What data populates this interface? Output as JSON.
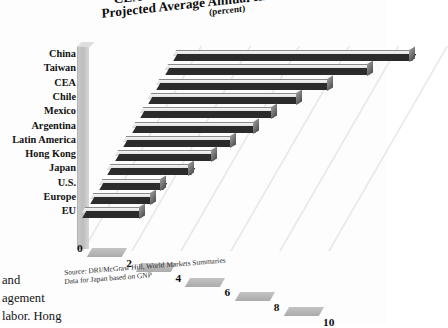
{
  "title": {
    "line1": "CEA Growth Relative to Other Regions",
    "line2": "Projected Average Annual Increases in GDP",
    "line3": "(percent)"
  },
  "source_note": {
    "line1": "Source: DRI/McGraw Hill, World Markets Summaries",
    "line2": "Data for Japan based on GNP"
  },
  "page_text": {
    "line1": "and",
    "line2": "agement",
    "line3": "labor.  Hong"
  },
  "colors": {
    "bar_face": "#2b2b2b",
    "bar_top": "#e2e2e2",
    "bar_cap": "#6d6d6d",
    "grid": "#e9e9e9",
    "wall": "#c3c3c3",
    "floor": "#b4b4b4",
    "text": "#121212"
  },
  "chart_data": {
    "type": "bar",
    "orientation": "horizontal",
    "xlabel": "",
    "ylabel": "",
    "xlim": [
      0,
      10
    ],
    "xticks": [
      0,
      2,
      4,
      6,
      8,
      10
    ],
    "grid": true,
    "legend": "none",
    "style": "3d-perspective",
    "categories": [
      "China",
      "Taiwan",
      "CEA",
      "Chile",
      "Mexico",
      "Argentina",
      "Latin America",
      "Hong Kong",
      "Japan",
      "U.S.",
      "Europe",
      "EU"
    ],
    "values": [
      9.7,
      8.3,
      7.0,
      6.1,
      5.4,
      5.0,
      4.4,
      4.0,
      3.4,
      2.6,
      2.5,
      2.4
    ],
    "series": [
      {
        "name": "Projected average annual increase in GDP 1993-1999 (percent)",
        "values": [
          9.7,
          8.3,
          7.0,
          6.1,
          5.4,
          5.0,
          4.4,
          4.0,
          3.4,
          2.6,
          2.5,
          2.4
        ]
      }
    ],
    "annotations": [
      "Source: DRI/McGraw Hill, World Markets Summaries",
      "Data for Japan based on GNP"
    ]
  }
}
